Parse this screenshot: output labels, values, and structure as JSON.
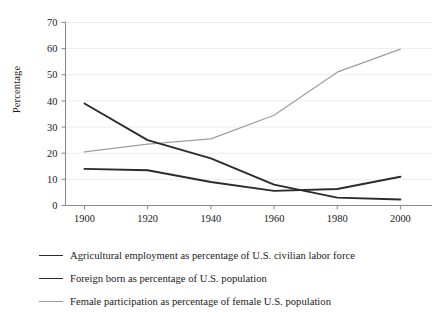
{
  "figure": {
    "background": "#ffffff",
    "ylabel": "Percentage"
  },
  "axis": {
    "y_ticks": [
      "0",
      "10",
      "20",
      "30",
      "40",
      "50",
      "60",
      "70"
    ],
    "x_ticks": [
      "1900",
      "1920",
      "1940",
      "1960",
      "1980",
      "2000"
    ],
    "axis_color": "#8a8a8a",
    "grid_color": "#ececec"
  },
  "legend": {
    "items": [
      {
        "label": "Agricultural employment as percentage of U.S. civilian labor force",
        "color": "#2b2b2b",
        "width": "1.9"
      },
      {
        "label": "Foreign born as percentage of U.S. population",
        "color": "#2b2b2b",
        "width": "1.9"
      },
      {
        "label": "Female participation as percentage of female U.S. population",
        "color": "#9e9e9e",
        "width": "1.2"
      }
    ]
  },
  "chart_data": {
    "type": "line",
    "title": "",
    "xlabel": "",
    "ylabel": "Percentage",
    "xlim": [
      1894,
      2010
    ],
    "ylim": [
      0,
      70
    ],
    "grid": true,
    "grid_axis": "y",
    "legend_position": "below",
    "x": [
      1900,
      1920,
      1940,
      1960,
      1980,
      2000
    ],
    "series": [
      {
        "name": "Agricultural employment as percentage of U.S. civilian labor force",
        "color": "#2b2b2b",
        "linewidth": 1.9,
        "values": [
          39.0,
          25.0,
          18.0,
          8.0,
          3.0,
          2.3
        ]
      },
      {
        "name": "Foreign born as percentage of U.S. population",
        "color": "#2b2b2b",
        "linewidth": 1.9,
        "values": [
          14.0,
          13.5,
          9.0,
          5.6,
          6.3,
          11.0
        ]
      },
      {
        "name": "Female participation as percentage of female U.S. population",
        "color": "#9e9e9e",
        "linewidth": 1.2,
        "values": [
          20.5,
          23.5,
          25.5,
          34.5,
          51.0,
          59.8
        ]
      }
    ]
  }
}
